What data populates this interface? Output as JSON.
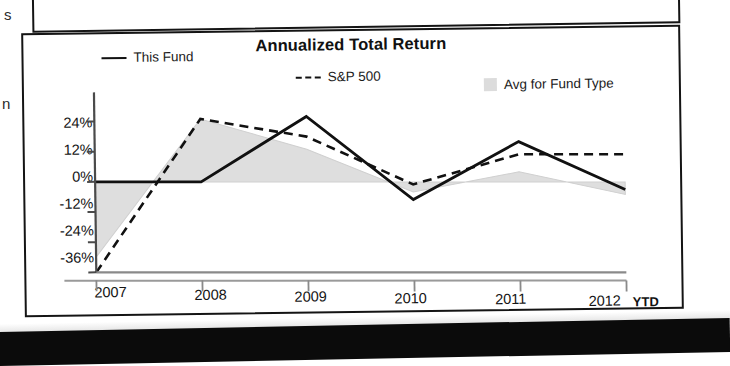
{
  "scan": {
    "edge_letter_top": "s",
    "edge_letter_mid": "n"
  },
  "chart": {
    "title": "Annualized Total Return",
    "legend": [
      {
        "label": "This Fund",
        "marker": "solid-line-swatch"
      },
      {
        "label": "S&P 500",
        "marker": "dashed-line-swatch"
      },
      {
        "label": "Avg for Fund Type",
        "marker": "gray-box-swatch"
      }
    ],
    "y_ticks": [
      "24%",
      "12%",
      "0%",
      "-12%",
      "-24%",
      "-36%"
    ],
    "x_ticks": [
      "2007",
      "2008",
      "2009",
      "2010",
      "2011",
      "2012"
    ],
    "x_suffix": "YTD"
  },
  "chart_data": {
    "type": "line",
    "title": "Annualized Total Return",
    "xlabel": "",
    "ylabel": "",
    "x": [
      "2007",
      "2008",
      "2009",
      "2010",
      "2011",
      "2012"
    ],
    "categories": [
      "2007",
      "2008",
      "2009",
      "2010",
      "2011",
      "2012"
    ],
    "ylim": [
      -36,
      30
    ],
    "yticks": [
      24,
      12,
      0,
      -12,
      -24,
      -36
    ],
    "ytick_labels": [
      "24%",
      "12%",
      "0%",
      "-12%",
      "-24%",
      "-36%"
    ],
    "grid": false,
    "legend_position": "top",
    "series": [
      {
        "name": "This Fund",
        "style": "solid",
        "color": "#111111",
        "values": [
          0,
          0,
          26,
          -7,
          16,
          -3
        ]
      },
      {
        "name": "S&P 500",
        "style": "dashed",
        "color": "#111111",
        "values": [
          -36,
          25,
          18,
          -1,
          11,
          11
        ]
      },
      {
        "name": "Avg for Fund Type",
        "style": "filled-area",
        "color": "#dcdcdc",
        "values": [
          -30,
          25,
          13,
          -4,
          4,
          -5
        ]
      }
    ],
    "annotations": [
      "YTD"
    ]
  }
}
